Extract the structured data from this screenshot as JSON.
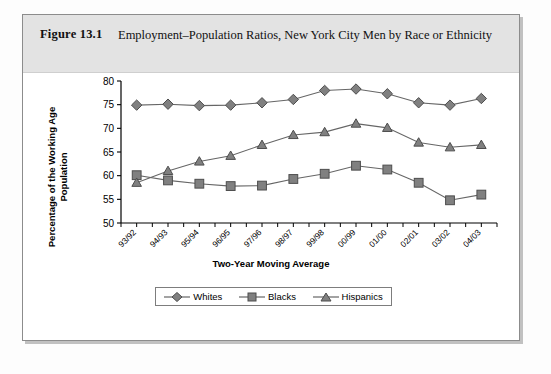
{
  "figure": {
    "label": "Figure 13.1",
    "title": "Employment–Population Ratios, New York City Men by Race or Ethnicity"
  },
  "colors": {
    "marker_fill": "#808080",
    "marker_stroke": "#4d4d4d",
    "line": "#666666",
    "axis": "#000000",
    "header_band": "#e3e3e3",
    "card_border": "#8c8c8c"
  },
  "legend": {
    "position": "bottom",
    "entries": [
      {
        "label": "Whites",
        "marker": "diamond-marker"
      },
      {
        "label": "Blacks",
        "marker": "square-marker"
      },
      {
        "label": "Hispanics",
        "marker": "triangle-marker"
      }
    ]
  },
  "chart_data": {
    "type": "line",
    "title": "Employment–Population Ratios, New York City Men by Race or Ethnicity",
    "xlabel": "Two-Year Moving Average",
    "ylabel": "Percentage of the Working Age Population",
    "ylim": [
      50,
      80
    ],
    "yticks": [
      50,
      55,
      60,
      65,
      70,
      75,
      80
    ],
    "grid": false,
    "legend_position": "bottom",
    "categories": [
      "93/92",
      "94/93",
      "95/94",
      "96/95",
      "97/96",
      "98/97",
      "99/98",
      "00/99",
      "01/00",
      "02/01",
      "03/02",
      "04/03"
    ],
    "series": [
      {
        "name": "Whites",
        "marker": "diamond",
        "values": [
          74.9,
          75.1,
          74.8,
          74.9,
          75.4,
          76.1,
          78.0,
          78.3,
          77.3,
          75.4,
          74.9,
          76.3
        ]
      },
      {
        "name": "Blacks",
        "marker": "square",
        "values": [
          60.1,
          59.0,
          58.3,
          57.8,
          57.9,
          59.3,
          60.4,
          62.1,
          61.3,
          58.5,
          54.8,
          56.0
        ]
      },
      {
        "name": "Hispanics",
        "marker": "triangle",
        "values": [
          58.5,
          61.0,
          63.0,
          64.2,
          66.5,
          68.6,
          69.2,
          71.0,
          70.1,
          67.0,
          66.0,
          66.5
        ]
      }
    ]
  }
}
